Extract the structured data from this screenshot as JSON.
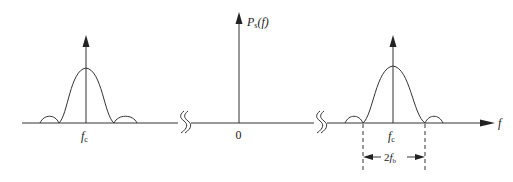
{
  "diagram": {
    "type": "power-spectral-density",
    "y_axis_label": {
      "main": "P",
      "sub": "s",
      "arg": "(f)"
    },
    "x_axis_label": "f",
    "origin_label": "0",
    "carrier_label_left": {
      "main": "f",
      "sub": "c"
    },
    "carrier_label_right": {
      "main": "f",
      "sub": "c"
    },
    "bandwidth_label": {
      "prefix": "2",
      "main": "f",
      "sub": "b"
    },
    "axis_breaks": 2,
    "lobes": [
      {
        "position": "left",
        "center_label": "fc",
        "shape": "sinc-squared main lobe with side lobes"
      },
      {
        "position": "right",
        "center_label": "fc",
        "shape": "sinc-squared main lobe with side lobes"
      }
    ],
    "colors": {
      "line": "#333333",
      "background": "#ffffff"
    }
  }
}
